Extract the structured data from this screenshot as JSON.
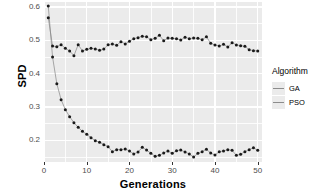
{
  "chart_data": {
    "type": "scatter",
    "title": "",
    "xlabel": "Generations",
    "ylabel": "SPD",
    "xlim": [
      0,
      51
    ],
    "ylim": [
      0.135,
      0.615
    ],
    "xticks": [
      0,
      10,
      20,
      30,
      40,
      50
    ],
    "xtick_labels": [
      "0",
      "10",
      "20",
      "30",
      "40",
      "50"
    ],
    "yticks": [
      0.2,
      0.3,
      0.4,
      0.5,
      0.6
    ],
    "ytick_labels": [
      "0.2",
      "0.3",
      "0.4",
      "0.5",
      "0.6"
    ],
    "grid": true,
    "grid_color": "#ffffff",
    "panel_color": "#ebebeb",
    "legend_position": "right",
    "legend_title": "Algorithm",
    "point_color": "#1a1a1a",
    "line_color": "#8c8c8c",
    "x": [
      1,
      2,
      3,
      4,
      5,
      6,
      7,
      8,
      9,
      10,
      11,
      12,
      13,
      14,
      15,
      16,
      17,
      18,
      19,
      20,
      21,
      22,
      23,
      24,
      25,
      26,
      27,
      28,
      29,
      30,
      31,
      32,
      33,
      34,
      35,
      36,
      37,
      38,
      39,
      40,
      41,
      42,
      43,
      44,
      45,
      46,
      47,
      48,
      49,
      50
    ],
    "series": [
      {
        "name": "GA",
        "color": "#8c8c8c",
        "values": [
          0.568,
          0.483,
          0.481,
          0.487,
          0.476,
          0.468,
          0.454,
          0.487,
          0.468,
          0.473,
          0.476,
          0.474,
          0.47,
          0.474,
          0.487,
          0.489,
          0.485,
          0.496,
          0.489,
          0.497,
          0.505,
          0.508,
          0.512,
          0.511,
          0.502,
          0.506,
          0.515,
          0.499,
          0.507,
          0.506,
          0.505,
          0.501,
          0.509,
          0.505,
          0.507,
          0.506,
          0.502,
          0.511,
          0.491,
          0.486,
          0.483,
          0.488,
          0.48,
          0.493,
          0.486,
          0.484,
          0.482,
          0.472,
          0.469,
          0.468
        ]
      },
      {
        "name": "PSO",
        "color": "#8c8c8c",
        "values": [
          0.603,
          0.45,
          0.37,
          0.322,
          0.292,
          0.271,
          0.253,
          0.239,
          0.227,
          0.218,
          0.208,
          0.199,
          0.194,
          0.187,
          0.181,
          0.166,
          0.172,
          0.172,
          0.174,
          0.168,
          0.159,
          0.165,
          0.179,
          0.171,
          0.161,
          0.152,
          0.155,
          0.162,
          0.168,
          0.161,
          0.169,
          0.171,
          0.165,
          0.159,
          0.15,
          0.161,
          0.166,
          0.173,
          0.162,
          0.156,
          0.166,
          0.168,
          0.172,
          0.17,
          0.155,
          0.158,
          0.166,
          0.172,
          0.178,
          0.17
        ]
      }
    ]
  }
}
